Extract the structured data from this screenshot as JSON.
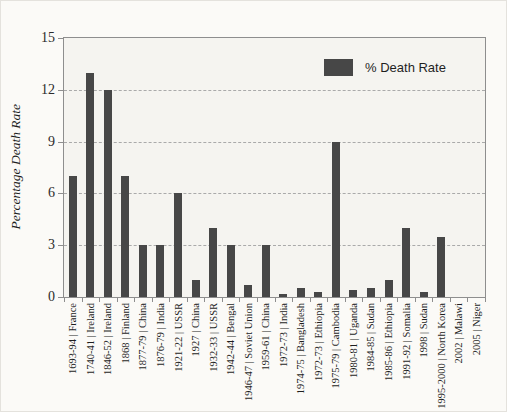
{
  "chart_data": {
    "type": "bar",
    "title": "",
    "xlabel": "",
    "ylabel": "Percentage Death Rate",
    "legend_label": "% Death Rate",
    "legend_position": "top-right-inside",
    "ylim": [
      0,
      15
    ],
    "yticks": [
      0,
      3,
      6,
      9,
      12,
      15
    ],
    "grid": "horizontal dashed at 3, 6, 9, 12",
    "bar_color": "#474747",
    "plot_bg_color": "#f5f4f0",
    "axis_color": "#8e8e8e",
    "categories": [
      "1693-94 | France",
      "1740-41 | Ireland",
      "1846-52 | Ireland",
      "1868 | Finland",
      "1877-79 | China",
      "1876-79 | India",
      "1921-22 | USSR",
      "1927 | China",
      "1932-33 | USSR",
      "1942-44 | Bengal",
      "1946-47 | Soviet Union",
      "1959-61 | China",
      "1972-73 | India",
      "1974-75 | Bangladesh",
      "1972-73 | Ethiopia",
      "1975-79 | Cambodia",
      "1980-81 | Uganda",
      "1984-85 | Sudan",
      "1985-86 | Ethiopia",
      "1991-92 | Somalia",
      "1998 | Sudan",
      "1995-2000 | North Korea",
      "2002 | Malawi",
      "2005 | Niger"
    ],
    "values": [
      7,
      13,
      12,
      7,
      3,
      3,
      6,
      1,
      4,
      3,
      0.7,
      3,
      0.15,
      0.5,
      0.3,
      9,
      0.4,
      0.55,
      1,
      4,
      0.3,
      3.5,
      0,
      0
    ]
  }
}
